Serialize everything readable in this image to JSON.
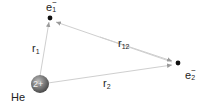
{
  "diagram": {
    "nucleus": {
      "element": "He",
      "charge": "2+",
      "fill_color": "#7a7a7a"
    },
    "electrons": [
      {
        "id": "e1",
        "base": "e",
        "subscript": "1",
        "superscript": "−"
      },
      {
        "id": "e2",
        "base": "e",
        "subscript": "2",
        "superscript": "−"
      }
    ],
    "distances": [
      {
        "id": "r1",
        "base": "r",
        "subscript": "1"
      },
      {
        "id": "r12",
        "base": "r",
        "subscript": "12"
      },
      {
        "id": "r2",
        "base": "r",
        "subscript": "2"
      }
    ],
    "line_color": "#c8c8c8",
    "dot_color": "#111111"
  }
}
